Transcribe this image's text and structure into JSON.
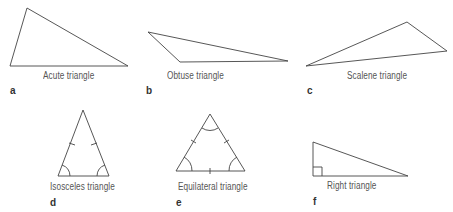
{
  "figures": [
    {
      "id": "a",
      "letter": "a",
      "label": "Acute triangle"
    },
    {
      "id": "b",
      "letter": "b",
      "label": "Obtuse triangle"
    },
    {
      "id": "c",
      "letter": "c",
      "label": "Scalene triangle"
    },
    {
      "id": "d",
      "letter": "d",
      "label": "Isosceles triangle"
    },
    {
      "id": "e",
      "letter": "e",
      "label": "Equilateral triangle"
    },
    {
      "id": "f",
      "letter": "f",
      "label": "Right triangle"
    }
  ],
  "colors": {
    "stroke": "#444444",
    "text": "#555555"
  }
}
